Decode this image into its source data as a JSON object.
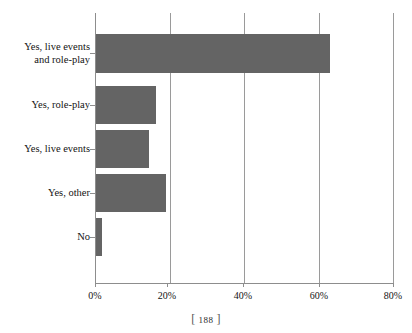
{
  "chart_data": {
    "type": "bar",
    "orientation": "horizontal",
    "title": "",
    "xlabel": "",
    "ylabel": "",
    "categories": [
      "Yes, live events\nand role-play",
      "Yes, role-play",
      "Yes, live events",
      "Yes, other",
      "No"
    ],
    "values": [
      63,
      16.5,
      14.5,
      19,
      2
    ],
    "value_labels": [
      "63%",
      "16.5%",
      "14.5%",
      "19%",
      "2%"
    ],
    "xlim": [
      0,
      80
    ],
    "xtick_values": [
      0,
      20,
      40,
      60,
      80
    ],
    "xtick_labels": [
      "0%",
      "20%",
      "40%",
      "60%",
      "80%"
    ],
    "grid": "vertical",
    "legend": "none",
    "bar_color": "#646464",
    "axis_color": "#8d8d8d",
    "gridline_color": "#9a9a9a",
    "background_color": "#ffffff"
  },
  "footer": {
    "bracket_open": "[",
    "page_number": "188",
    "bracket_close": "]"
  }
}
